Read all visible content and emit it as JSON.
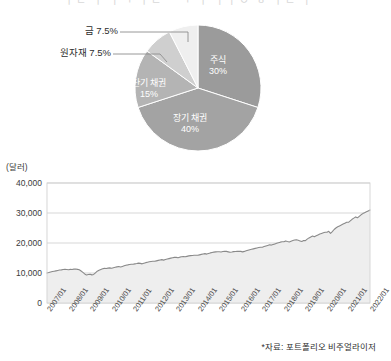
{
  "clipped_header": "ㅣㄷ ㅣ ㅏㄱ ㅣㄹ ㅡㄱ ㅣ ㅏㅏㅇ ㅎ ㅣㄹ ㅏ",
  "pie": {
    "slices": [
      {
        "name": "stocks",
        "label": "주식",
        "value_label": "30%",
        "value": 30,
        "color": "#9b9b9b",
        "label_color": "white"
      },
      {
        "name": "long-term-bonds",
        "label": "장기 채권",
        "value_label": "40%",
        "value": 40,
        "color": "#a3a3a3",
        "label_color": "white"
      },
      {
        "name": "short-term-bonds",
        "label": "단기 채권",
        "value_label": "15%",
        "value": 15,
        "color": "#b4b4b4",
        "label_color": "white"
      },
      {
        "name": "commodities",
        "label": "원자재",
        "value_label": "7.5%",
        "value": 7.5,
        "color": "#cfcfcf",
        "label_color": "dark"
      },
      {
        "name": "gold",
        "label": "금",
        "value_label": "7.5%",
        "value": 7.5,
        "color": "#efefef",
        "label_color": "dark"
      }
    ],
    "callouts": [
      {
        "name": "gold",
        "text": "금 7.5%"
      },
      {
        "name": "commodities",
        "text": "원자재 7.5%"
      }
    ]
  },
  "line_chart": {
    "unit": "(달러)",
    "source_note": "*자료: 포트폴리오 비주얼라이저"
  },
  "chart_data": [
    {
      "type": "pie",
      "title": "",
      "categories": [
        "주식",
        "장기 채권",
        "단기 채권",
        "원자재",
        "금"
      ],
      "values": [
        30,
        40,
        15,
        7.5,
        7.5
      ],
      "value_labels": [
        "30%",
        "40%",
        "15%",
        "7.5%",
        "7.5%"
      ],
      "colors": [
        "#9b9b9b",
        "#a3a3a3",
        "#b4b4b4",
        "#cfcfcf",
        "#efefef"
      ],
      "start_angle_deg": 0,
      "direction": "clockwise",
      "legend": "none",
      "annotations": [
        "금 7.5%",
        "원자재 7.5%"
      ]
    },
    {
      "type": "line",
      "title": "",
      "xlabel": "",
      "ylabel": "(달러)",
      "ylim": [
        0,
        40000
      ],
      "yticks": [
        0,
        10000,
        20000,
        30000,
        40000
      ],
      "ytick_labels": [
        "0",
        "10,000",
        "20,000",
        "30,000",
        "40,000"
      ],
      "grid": true,
      "legend": "none",
      "area_fill": true,
      "x": [
        "2007/01",
        "2008/01",
        "2009/01",
        "2010/01",
        "2011/01",
        "2012/01",
        "2013/01",
        "2014/01",
        "2015/01",
        "2016/01",
        "2017/01",
        "2018/01",
        "2019/01",
        "2020/01",
        "2021/01",
        "2022/01"
      ],
      "series": [
        {
          "name": "portfolio-value",
          "values": [
            10000,
            11100,
            9600,
            11600,
            12900,
            13900,
            15200,
            15900,
            17100,
            17200,
            18600,
            20400,
            20800,
            23600,
            26900,
            31000
          ]
        }
      ],
      "monthly_values": [
        10000,
        10150,
        10320,
        10480,
        10600,
        10720,
        10850,
        10980,
        11050,
        11180,
        11260,
        11180,
        11100,
        11200,
        11150,
        11280,
        11320,
        11200,
        11080,
        10650,
        10200,
        9700,
        9350,
        9500,
        9600,
        9380,
        9520,
        10050,
        10600,
        10900,
        11150,
        11400,
        11550,
        11500,
        11620,
        11700,
        11600,
        11750,
        11900,
        12050,
        12150,
        12000,
        12200,
        12400,
        12600,
        12700,
        12820,
        12900,
        12900,
        13050,
        13150,
        13300,
        13200,
        13050,
        13250,
        13450,
        13600,
        13750,
        13850,
        13900,
        13900,
        14050,
        14200,
        14350,
        14450,
        14300,
        14480,
        14650,
        14800,
        14950,
        15080,
        15200,
        15200,
        15100,
        15280,
        15400,
        15520,
        15400,
        15550,
        15700,
        15800,
        15850,
        15900,
        15900,
        15900,
        16050,
        16200,
        16350,
        16450,
        16300,
        16500,
        16700,
        16850,
        16950,
        17050,
        17100,
        17100,
        17000,
        17150,
        17250,
        17200,
        17050,
        16900,
        17000,
        17120,
        17180,
        17220,
        17200,
        17200,
        17050,
        17200,
        17400,
        17600,
        17750,
        17900,
        18050,
        18200,
        18350,
        18480,
        18600,
        18600,
        18800,
        19000,
        19200,
        19400,
        19300,
        19500,
        19700,
        19900,
        20100,
        20280,
        20400,
        20400,
        20700,
        20500,
        20350,
        20600,
        20800,
        21000,
        21100,
        20900,
        20700,
        20500,
        20800,
        20800,
        21300,
        21700,
        22000,
        22300,
        22100,
        22400,
        22700,
        23000,
        23200,
        23400,
        23600,
        23600,
        23900,
        23200,
        23800,
        24500,
        25000,
        25400,
        25700,
        26000,
        26300,
        26600,
        26900,
        26900,
        27400,
        27900,
        28300,
        28700,
        28400,
        28900,
        29400,
        29800,
        30100,
        30400,
        30700,
        31000
      ]
    }
  ]
}
